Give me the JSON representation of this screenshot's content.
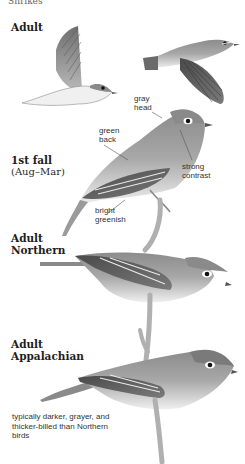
{
  "page": {
    "top_cut_text": "Shrikes"
  },
  "sections": [
    {
      "heading": "Adult",
      "sub": null
    },
    {
      "heading": "1st fall",
      "sub": "(Aug–Mar)"
    },
    {
      "heading": "Adult",
      "heading2": "Northern"
    },
    {
      "heading": "Adult",
      "heading2": "Appalachian"
    }
  ],
  "labels": {
    "gray_head": [
      "gray",
      "head"
    ],
    "green_back": [
      "green",
      "back"
    ],
    "strong_contrast": [
      "strong",
      "contrast"
    ],
    "bright_greenish": [
      "bright",
      "greenish"
    ]
  },
  "note": {
    "appalachian": "typically darker, grayer, and thicker-billed than Northern birds"
  },
  "colors": {
    "background": "#ffffff",
    "bird_gray": "#8a8a8a",
    "bird_dark": "#4a4a4a",
    "bird_light": "#e6e6e6",
    "text": "#222222"
  }
}
